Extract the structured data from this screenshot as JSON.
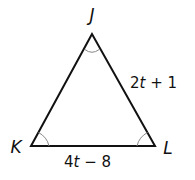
{
  "diagram": {
    "type": "triangle",
    "vertices": [
      {
        "label": "J",
        "x": 92,
        "y": 34
      },
      {
        "label": "K",
        "x": 31,
        "y": 146
      },
      {
        "label": "L",
        "x": 155,
        "y": 146
      }
    ],
    "sides": [
      {
        "between": "JL",
        "label_coef": "2",
        "label_var": "t",
        "label_rest": " + 1",
        "label": "2t + 1"
      },
      {
        "between": "KL",
        "label_coef": "4",
        "label_var": "t",
        "label_rest": " − 8",
        "label": "4t − 8"
      }
    ],
    "angle_marks": [
      "J",
      "K",
      "L"
    ],
    "colors": {
      "stroke": "#111111",
      "arc": "#888888"
    }
  }
}
